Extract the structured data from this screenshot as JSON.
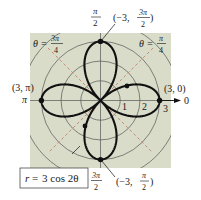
{
  "figure": {
    "type": "polar-graph",
    "equation": "r = 3 cos 2θ",
    "equation_label": {
      "lhs": "r",
      "eq": "=",
      "rhs": "3 cos 2θ"
    },
    "center_px": [
      100.5,
      100.5
    ],
    "unit_px": 19.7,
    "radial_ticks": [
      "1",
      "2",
      "3"
    ],
    "polar_axis_label": "0",
    "angle_labels": {
      "top": {
        "num": "π",
        "den": "2"
      },
      "bottom": {
        "num": "3π",
        "den": "2"
      },
      "left": "π",
      "right": "0"
    },
    "guide_lines": [
      {
        "label": "θ =",
        "num": "3π",
        "den": "4"
      },
      {
        "label": "θ =",
        "num": "π",
        "den": "4"
      }
    ],
    "points": [
      {
        "label": "(3, 0)"
      },
      {
        "label": "(3, π)"
      },
      {
        "label_prefix": "(−3,",
        "num": "3π",
        "den": "2",
        "label_suffix": ")"
      },
      {
        "label_prefix": "(−3,",
        "num": "π",
        "den": "2",
        "label_suffix": ")"
      }
    ],
    "colors": {
      "panel": "#d9dcc9",
      "curve": "#111111",
      "grid": "#555555",
      "guide": "#c8826a",
      "label_box": "#ffffff"
    }
  }
}
